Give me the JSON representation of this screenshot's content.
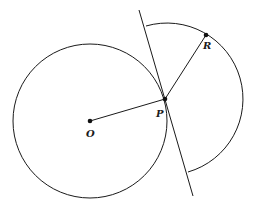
{
  "diagram": {
    "type": "geometry",
    "colors": {
      "stroke": "#1a1a1a",
      "background": "#ffffff"
    },
    "points": [
      {
        "id": "O",
        "label": "O",
        "x": 90,
        "y": 121
      },
      {
        "id": "P",
        "label": "P",
        "x": 165,
        "y": 99
      },
      {
        "id": "R",
        "label": "R",
        "x": 206,
        "y": 35
      }
    ],
    "circle": {
      "center": "O",
      "cx": 90,
      "cy": 121,
      "r": 77
    },
    "arc": {
      "center": "P",
      "cx": 165,
      "cy": 99,
      "r": 75,
      "start": [
        146,
        26
      ],
      "end": [
        188,
        172
      ]
    },
    "tangent_line": {
      "through": "P",
      "x1": 139,
      "y1": 10,
      "x2": 193,
      "y2": 196
    },
    "segments": [
      {
        "from": "O",
        "to": "P"
      },
      {
        "from": "P",
        "to": "R"
      }
    ]
  }
}
